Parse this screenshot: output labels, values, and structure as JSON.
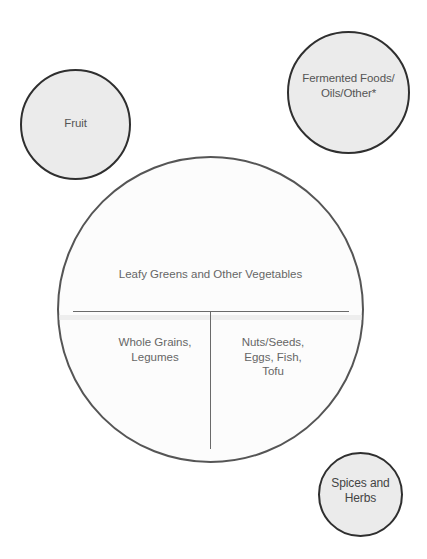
{
  "diagram": {
    "type": "healthy-plate",
    "colors": {
      "small_circle_fill": "#ebebeb",
      "small_circle_border": "#2f2f2f",
      "plate_border": "#555555",
      "plate_fill": "#fcfcfc",
      "label_text": "#666666"
    },
    "side_circles": {
      "fruit": {
        "lines": [
          "Fruit"
        ]
      },
      "fermented": {
        "lines": [
          "Fermented Foods/",
          "Oils/Other*"
        ]
      },
      "spices": {
        "lines": [
          "Spices and",
          "Herbs"
        ]
      }
    },
    "plate": {
      "top_section": {
        "lines": [
          "Leafy Greens and Other Vegetables"
        ]
      },
      "bottom_left_section": {
        "lines": [
          "Whole Grains,",
          "Legumes"
        ]
      },
      "bottom_right_section": {
        "lines": [
          "Nuts/Seeds,",
          "Eggs, Fish,",
          "Tofu"
        ]
      }
    }
  }
}
